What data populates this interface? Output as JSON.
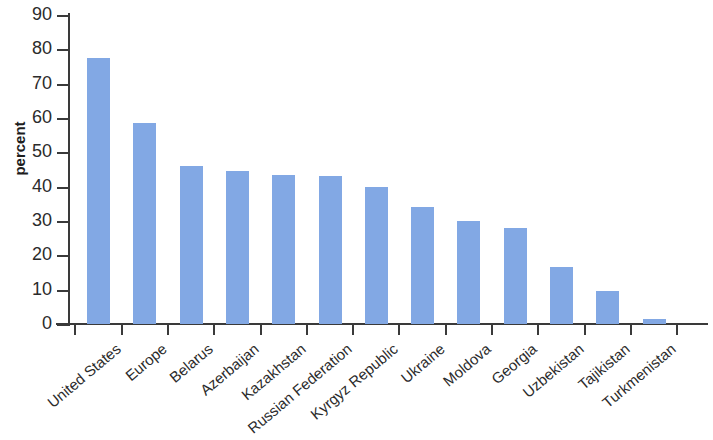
{
  "chart_data": {
    "type": "bar",
    "title": "",
    "subtitle": "",
    "xlabel": "",
    "ylabel": "percent",
    "ylim": [
      0,
      90
    ],
    "y_ticks": [
      0,
      10,
      20,
      30,
      40,
      50,
      60,
      70,
      80,
      90
    ],
    "grid": false,
    "legend": false,
    "bar_color": "#82a8e4",
    "axis_color": "#3a3a3a",
    "text_color": "#2b2b2b",
    "categories": [
      "United States",
      "Europe",
      "Belarus",
      "Azerbaijan",
      "Kazakhstan",
      "Russian Federation",
      "Kyrgyz Republic",
      "Ukraine",
      "Moldova",
      "Georgia",
      "Uzbekistan",
      "Tajikistan",
      "Turkmenistan"
    ],
    "values": [
      77.5,
      58.5,
      46.0,
      44.5,
      43.5,
      43.0,
      40.0,
      34.0,
      30.0,
      28.0,
      16.5,
      9.5,
      1.5
    ]
  }
}
